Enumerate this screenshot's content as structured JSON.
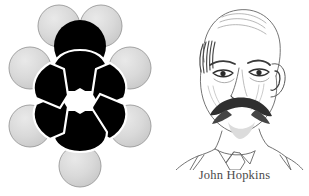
{
  "figure": {
    "background_color": "#ffffff",
    "layout": "two-panel: molecular model left, portrait right"
  },
  "molecule": {
    "name": "toluene-space-filling-model",
    "title": "Toluene space-filling model",
    "carbon_color": "#000000",
    "hydrogen_color": "#d6d6d6",
    "hydrogen_outline_color": "#8f8f8f",
    "ring_cavity_color": "#ffffff",
    "atoms": [
      {
        "label": "C1",
        "element": "C",
        "role": "ring-carbon-top",
        "color": "#000000"
      },
      {
        "label": "C2",
        "element": "C",
        "role": "ring-carbon-upper-right",
        "color": "#000000"
      },
      {
        "label": "C3",
        "element": "C",
        "role": "ring-carbon-lower-right",
        "color": "#000000"
      },
      {
        "label": "C4",
        "element": "C",
        "role": "ring-carbon-bottom",
        "color": "#000000"
      },
      {
        "label": "C5",
        "element": "C",
        "role": "ring-carbon-lower-left",
        "color": "#000000"
      },
      {
        "label": "C6",
        "element": "C",
        "role": "ring-carbon-upper-left",
        "color": "#000000"
      },
      {
        "label": "C7",
        "element": "C",
        "role": "methyl-carbon",
        "color": "#000000"
      },
      {
        "label": "H1",
        "element": "H",
        "role": "methyl-hydrogen-left",
        "color": "#d6d6d6"
      },
      {
        "label": "H2",
        "element": "H",
        "role": "methyl-hydrogen-right",
        "color": "#d6d6d6"
      },
      {
        "label": "H3",
        "element": "H",
        "role": "ring-hydrogen-upper-left",
        "color": "#d6d6d6"
      },
      {
        "label": "H4",
        "element": "H",
        "role": "ring-hydrogen-lower-left",
        "color": "#d6d6d6"
      },
      {
        "label": "H5",
        "element": "H",
        "role": "ring-hydrogen-upper-right",
        "color": "#d6d6d6"
      },
      {
        "label": "H6",
        "element": "H",
        "role": "ring-hydrogen-lower-right",
        "color": "#d6d6d6"
      },
      {
        "label": "H7",
        "element": "H",
        "role": "ring-hydrogen-bottom",
        "color": "#d6d6d6"
      }
    ]
  },
  "portrait": {
    "caption": "John Hopkins",
    "subject": "elderly balding man with moustache, wearing collar and tie",
    "style": "engraved line drawing",
    "line_color": "#555555"
  }
}
